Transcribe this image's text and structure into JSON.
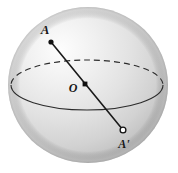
{
  "figure": {
    "type": "geometry-diagram",
    "background_color": "#ffffff",
    "sphere": {
      "name": "sphere",
      "center_x": 88,
      "center_y": 85,
      "radius_x": 80,
      "radius_y": 78,
      "fill_light": "#fcfcfc",
      "fill_mid": "#dcdcdc",
      "fill_dark": "#b4b4b4",
      "highlight_x": 52,
      "highlight_y": 42,
      "outline_color": "#b0b0b0"
    },
    "equator": {
      "name": "equator-ellipse",
      "center_x": 87,
      "center_y": 85,
      "radius_x": 76,
      "radius_y": 25,
      "stroke_color": "#2b2b2b",
      "stroke_width": 1.1,
      "back_half_style": "dashed",
      "front_half_style": "solid",
      "dash_pattern": "6 4"
    },
    "diameter": {
      "name": "diameter-line",
      "x1": 51,
      "y1": 42,
      "x2": 123,
      "y2": 130,
      "stroke_color": "#1a1a1a",
      "stroke_width": 1.6
    },
    "points": [
      {
        "id": "A",
        "name": "point-a",
        "label": "A",
        "marker": "filled-dot",
        "marker_x": 51,
        "marker_y": 42,
        "marker_radius": 2.6,
        "marker_fill": "#111111",
        "label_x": 45,
        "label_y": 34
      },
      {
        "id": "O",
        "name": "point-o-center",
        "label": "O",
        "marker": "filled-square-dot",
        "marker_x": 85,
        "marker_y": 84,
        "marker_radius": 2.4,
        "marker_fill": "#111111",
        "label_x": 73,
        "label_y": 92
      },
      {
        "id": "Aprime",
        "name": "point-a-prime",
        "label": "A'",
        "marker": "open-circle",
        "marker_x": 123,
        "marker_y": 130,
        "marker_radius": 2.9,
        "marker_fill": "#ffffff",
        "marker_stroke": "#111111",
        "label_x": 117,
        "label_y": 148
      }
    ]
  }
}
